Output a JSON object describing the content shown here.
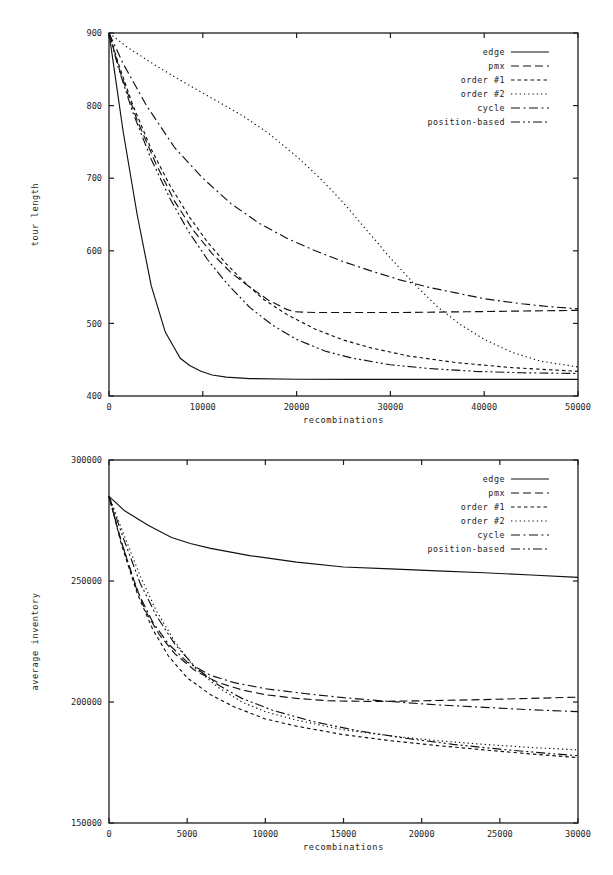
{
  "figure": {
    "background": "#ffffff",
    "ink": "#111111"
  },
  "legend": {
    "entries": [
      {
        "label": "edge",
        "style": "solid",
        "dash": "none"
      },
      {
        "label": "pmx",
        "style": "dashed",
        "dash": "8,4"
      },
      {
        "label": "order #1",
        "style": "short-dashed",
        "dash": "3.5,3"
      },
      {
        "label": "order #2",
        "style": "dotted",
        "dash": "1.3,3"
      },
      {
        "label": "cycle",
        "style": "dash-dot",
        "dash": "9,3.5,2,3.5"
      },
      {
        "label": "position-based",
        "style": "dash-dot-dot",
        "dash": "9,3,2,3,2,3"
      }
    ]
  },
  "chart_data": [
    {
      "id": "tour-length",
      "type": "line",
      "title": "",
      "xlabel": "recombinations",
      "ylabel": "tour length",
      "xlim": [
        0,
        50000
      ],
      "ylim": [
        400,
        900
      ],
      "xticks": [
        0,
        10000,
        20000,
        30000,
        40000,
        50000
      ],
      "xticklabels": [
        "0",
        "10000",
        "20000",
        "30000",
        "40000",
        "50000"
      ],
      "yticks": [
        400,
        500,
        600,
        700,
        800,
        900
      ],
      "yticklabels": [
        "400",
        "500",
        "600",
        "700",
        "800",
        "900"
      ],
      "grid": false,
      "legend_position": "top-right",
      "series": [
        {
          "name": "edge",
          "x": [
            0,
            500,
            1500,
            3000,
            4500,
            6000,
            6800,
            7600,
            8600,
            9800,
            11000,
            12500,
            15000,
            20000,
            26000,
            32000,
            40000,
            50000
          ],
          "y": [
            900,
            855,
            765,
            650,
            552,
            488,
            470,
            452,
            442,
            434,
            429,
            426,
            424,
            423,
            423,
            423,
            423,
            423
          ]
        },
        {
          "name": "pmx",
          "x": [
            0,
            1200,
            3000,
            5000,
            7000,
            9000,
            11000,
            13000,
            15000,
            17000,
            19000,
            19800,
            22000,
            26000,
            31000,
            38000,
            44000,
            50000
          ],
          "y": [
            900,
            846,
            780,
            720,
            668,
            628,
            596,
            570,
            550,
            532,
            519,
            516,
            515,
            515,
            515,
            516,
            517,
            518
          ]
        },
        {
          "name": "order #1",
          "x": [
            0,
            1000,
            2500,
            4500,
            6500,
            8500,
            10500,
            12500,
            14500,
            16500,
            19000,
            22000,
            25000,
            28000,
            32000,
            37000,
            43000,
            50000
          ],
          "y": [
            900,
            858,
            802,
            740,
            690,
            648,
            612,
            582,
            556,
            533,
            512,
            492,
            477,
            466,
            455,
            446,
            439,
            434
          ]
        },
        {
          "name": "order #2",
          "x": [
            0,
            2000,
            5000,
            8000,
            11000,
            14000,
            17000,
            20000,
            22500,
            25000,
            27500,
            30000,
            32500,
            35000,
            37500,
            40000,
            43000,
            46000,
            50000
          ],
          "y": [
            900,
            880,
            855,
            832,
            810,
            788,
            762,
            730,
            700,
            666,
            628,
            590,
            555,
            523,
            498,
            478,
            460,
            448,
            440
          ]
        },
        {
          "name": "cycle",
          "x": [
            0,
            1500,
            4000,
            7000,
            10000,
            13000,
            16000,
            19000,
            22000,
            25000,
            28000,
            31000,
            34000,
            37000,
            40000,
            44000,
            47000,
            50000
          ],
          "y": [
            900,
            858,
            800,
            742,
            700,
            665,
            638,
            617,
            600,
            585,
            572,
            560,
            550,
            542,
            534,
            527,
            523,
            520
          ]
        },
        {
          "name": "position-based",
          "x": [
            0,
            1000,
            2500,
            4500,
            6500,
            8500,
            10500,
            12500,
            15000,
            17500,
            20000,
            23000,
            26000,
            30000,
            34000,
            39000,
            44000,
            50000
          ],
          "y": [
            900,
            852,
            792,
            726,
            672,
            626,
            588,
            556,
            522,
            497,
            478,
            462,
            452,
            443,
            438,
            434,
            432,
            431
          ]
        }
      ]
    },
    {
      "id": "average-inventory",
      "type": "line",
      "title": "",
      "xlabel": "recombinations",
      "ylabel": "average inventory",
      "xlim": [
        0,
        30000
      ],
      "ylim": [
        150000,
        300000
      ],
      "xticks": [
        0,
        5000,
        10000,
        15000,
        20000,
        25000,
        30000
      ],
      "xticklabels": [
        "0",
        "5000",
        "10000",
        "15000",
        "20000",
        "25000",
        "30000"
      ],
      "yticks": [
        150000,
        200000,
        250000,
        300000
      ],
      "yticklabels": [
        "150000",
        "200000",
        "250000",
        "300000"
      ],
      "grid": false,
      "legend_position": "top-right",
      "series": [
        {
          "name": "edge",
          "x": [
            0,
            1000,
            2500,
            4000,
            5200,
            6500,
            9000,
            12000,
            15000,
            18000,
            21000,
            24000,
            27000,
            30000
          ],
          "y": [
            285000,
            279000,
            273000,
            268000,
            265500,
            263500,
            260500,
            257800,
            255800,
            255000,
            254200,
            253400,
            252500,
            251500
          ]
        },
        {
          "name": "pmx",
          "x": [
            0,
            700,
            1500,
            2300,
            3200,
            4200,
            5500,
            7000,
            8500,
            10000,
            12000,
            14000,
            17000,
            20000,
            24000,
            27000,
            30000
          ],
          "y": [
            285000,
            268000,
            252000,
            238000,
            228000,
            220000,
            213000,
            208000,
            205000,
            203000,
            201500,
            200500,
            200200,
            200500,
            201000,
            201500,
            202000
          ]
        },
        {
          "name": "order #1",
          "x": [
            0,
            800,
            1800,
            2800,
            3800,
            5000,
            6500,
            8000,
            10000,
            12000,
            15000,
            18000,
            21000,
            24000,
            27000,
            30000
          ],
          "y": [
            285000,
            265000,
            245000,
            230000,
            219000,
            210000,
            203000,
            198000,
            193000,
            190000,
            186500,
            184000,
            182000,
            180200,
            178500,
            177000
          ]
        },
        {
          "name": "order #2",
          "x": [
            0,
            900,
            2000,
            3000,
            4200,
            5500,
            7000,
            8500,
            10000,
            12000,
            15000,
            18000,
            21000,
            24000,
            27000,
            30000
          ],
          "y": [
            285000,
            270000,
            252000,
            238000,
            225000,
            214000,
            206000,
            200000,
            196000,
            192500,
            188500,
            186000,
            184000,
            182500,
            181200,
            180200
          ]
        },
        {
          "name": "cycle",
          "x": [
            0,
            800,
            1800,
            2800,
            3800,
            5000,
            6500,
            8000,
            10000,
            12500,
            15000,
            18000,
            21000,
            24000,
            27000,
            30000
          ],
          "y": [
            285000,
            266000,
            246000,
            233000,
            224000,
            216500,
            211000,
            208000,
            205500,
            203500,
            201800,
            200200,
            198800,
            197800,
            196800,
            196000
          ]
        },
        {
          "name": "position-based",
          "x": [
            0,
            900,
            2000,
            3000,
            4200,
            5500,
            7000,
            8500,
            10500,
            13000,
            16000,
            19000,
            22000,
            25000,
            28000,
            30000
          ],
          "y": [
            285000,
            268000,
            249000,
            236000,
            224000,
            214500,
            207000,
            201500,
            196500,
            192000,
            188000,
            185000,
            182500,
            180500,
            178800,
            177800
          ]
        }
      ]
    }
  ]
}
